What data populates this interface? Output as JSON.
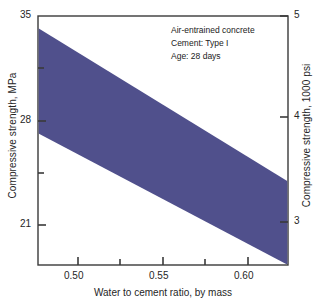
{
  "chart_data": {
    "type": "area",
    "title": "",
    "subtitle": "",
    "xlabel": "Water to cement ratio, by mass",
    "ylabel": "Compressive strength, MPa",
    "ylabel_right": "Compressive strength, 1000 psi",
    "xlim": [
      0.4765,
      0.6235
    ],
    "ylim": [
      18.45,
      35.0
    ],
    "ylim_right": [
      2.675,
      5.0
    ],
    "grid": false,
    "legend": null,
    "xticks": [
      0.5,
      0.55,
      0.6
    ],
    "xtick_labels": [
      "0.50",
      "0.55",
      "0.60"
    ],
    "xminor_ticks": [
      0.525,
      0.575,
      0.625
    ],
    "yticks_left": [
      21,
      28,
      35
    ],
    "ytick_labels_left": [
      "21",
      "28",
      "35"
    ],
    "yminor_ticks_left": [
      24.5,
      31.5
    ],
    "yticks_right": [
      3,
      4,
      5
    ],
    "ytick_labels_right": [
      "3",
      "4",
      "5"
    ],
    "band_color": "#50508c",
    "series": [
      {
        "name": "upper bound",
        "x": [
          0.4765,
          0.6235
        ],
        "values": [
          34.2,
          24.0
        ]
      },
      {
        "name": "lower bound",
        "x": [
          0.4765,
          0.6235
        ],
        "values": [
          27.2,
          18.45
        ]
      }
    ],
    "annotations": [
      "Air-entrained concrete",
      "Cement: Type I",
      "Age: 28 days"
    ]
  },
  "annotation": {
    "line1": "Air-entrained concrete",
    "line2": "Cement: Type I",
    "line3": "Age: 28 days"
  },
  "axes": {
    "x_title": "Water to cement ratio, by mass",
    "y_left_title": "Compressive strength, MPa",
    "y_right_title": "Compressive strength, 1000 psi",
    "x_tick_1": "0.50",
    "x_tick_2": "0.55",
    "x_tick_3": "0.60",
    "y_left_tick_1": "35",
    "y_left_tick_2": "28",
    "y_left_tick_3": "21",
    "y_right_tick_1": "5",
    "y_right_tick_2": "4",
    "y_right_tick_3": "3"
  }
}
